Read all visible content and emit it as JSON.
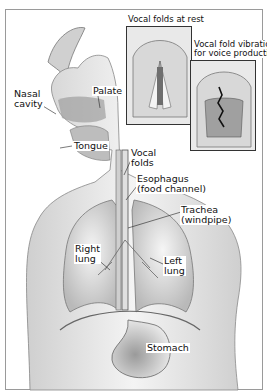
{
  "diagram": {
    "type": "anatomical illustration"
  },
  "insets": [
    {
      "title": "Vocal folds at rest"
    },
    {
      "title_line1": "Vocal fold vibration",
      "title_line2": "for voice production"
    }
  ],
  "labels": {
    "nasal_cavity": {
      "line1": "Nasal",
      "line2": "cavity"
    },
    "palate": "Palate",
    "tongue": "Tongue",
    "vocal_folds": {
      "line1": "Vocal",
      "line2": "folds"
    },
    "esophagus": {
      "line1": "Esophagus",
      "line2": "(food channel)"
    },
    "trachea": {
      "line1": "Trachea",
      "line2": "(windpipe)"
    },
    "right_lung": {
      "line1": "Right",
      "line2": "lung"
    },
    "left_lung": {
      "line1": "Left",
      "line2": "lung"
    },
    "stomach": "Stomach"
  },
  "colors": {
    "border": "#9a9a9a",
    "ink": "#111111",
    "shade": "#bdbdbd"
  }
}
